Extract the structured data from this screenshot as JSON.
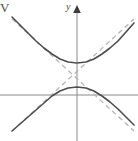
{
  "figure": {
    "corner_label": "V",
    "y_axis_label": "y",
    "background_color": "#ffffff",
    "curve_color": "#4d4d4d",
    "asymptote_color": "#b4b4b4",
    "axis_color": "#8a8a8a"
  },
  "chart_data": {
    "type": "line",
    "title": "",
    "subtitle": "",
    "xlabel": "",
    "ylabel": "y",
    "annotations": [
      "V"
    ],
    "grid": false,
    "legend_position": "none",
    "axes": {
      "x_axis": {
        "visible": true,
        "pixel_y": 95,
        "x_from": 0,
        "x_to": 138,
        "arrow": false
      },
      "y_axis": {
        "visible": true,
        "pixel_x": 77,
        "y_from": 8,
        "y_to": 141,
        "arrow": "up"
      }
    },
    "center_pixel": {
      "x": 77,
      "y": 75
    },
    "xlim": [
      -77,
      61
    ],
    "ylim": [
      -66,
      75
    ],
    "series": [
      {
        "name": "hyperbola-upper-branch",
        "style": "solid",
        "color": "#4d4d4d",
        "points": [
          [
            12,
            17
          ],
          [
            20,
            25
          ],
          [
            28,
            33
          ],
          [
            36,
            41
          ],
          [
            44,
            48
          ],
          [
            52,
            54
          ],
          [
            60,
            59
          ],
          [
            68,
            62
          ],
          [
            77,
            63
          ],
          [
            86,
            62
          ],
          [
            94,
            59
          ],
          [
            102,
            54
          ],
          [
            110,
            48
          ],
          [
            118,
            41
          ],
          [
            126,
            32
          ],
          [
            134,
            23
          ]
        ]
      },
      {
        "name": "hyperbola-lower-branch",
        "style": "solid",
        "color": "#4d4d4d",
        "points": [
          [
            12,
            131
          ],
          [
            20,
            124
          ],
          [
            28,
            117
          ],
          [
            36,
            110
          ],
          [
            44,
            103
          ],
          [
            52,
            96
          ],
          [
            60,
            91
          ],
          [
            68,
            88
          ],
          [
            77,
            87
          ],
          [
            86,
            88
          ],
          [
            94,
            91
          ],
          [
            102,
            96
          ],
          [
            110,
            102
          ],
          [
            118,
            109
          ],
          [
            126,
            117
          ],
          [
            134,
            125
          ]
        ]
      },
      {
        "name": "asymptote-positive-slope",
        "style": "dashed",
        "color": "#b4b4b4",
        "points": [
          [
            12,
            131
          ],
          [
            134,
            19
          ]
        ]
      },
      {
        "name": "asymptote-negative-slope",
        "style": "dashed",
        "color": "#b4b4b4",
        "points": [
          [
            12,
            19
          ],
          [
            134,
            131
          ]
        ]
      }
    ],
    "vertices": [
      {
        "name": "upper-vertex",
        "pixel": [
          77,
          63
        ]
      },
      {
        "name": "lower-vertex",
        "pixel": [
          77,
          87
        ]
      }
    ]
  }
}
